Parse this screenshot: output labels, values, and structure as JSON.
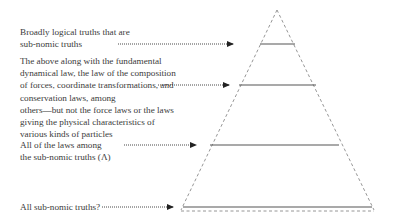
{
  "diagram": {
    "type": "pyramid-of-truths",
    "labels": [
      {
        "id": "level-1",
        "lines": [
          "Broadly logical truths that are",
          "sub-nomic truths"
        ]
      },
      {
        "id": "level-2",
        "lines": [
          "The above along with the fundamental",
          "dynamical law, the law of the composition",
          "of forces, coordinate transformations, and",
          "conservation laws, among",
          "others—but not the force laws or the laws",
          "giving the physical characteristics of",
          "various kinds of particles"
        ]
      },
      {
        "id": "level-3",
        "lines": [
          "All of the laws among",
          "the sub-nomic truths (Λ)"
        ]
      },
      {
        "id": "level-4",
        "lines": [
          "All sub-nomic truths?"
        ]
      }
    ],
    "colors": {
      "text": "#3b3b3b",
      "lines": "#555555",
      "dashed": "#888888"
    }
  }
}
